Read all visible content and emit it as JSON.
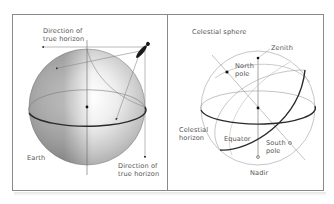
{
  "left_panel": {
    "labels": {
      "direction_top_line1": "Direction of",
      "direction_top_line2": "true horizon",
      "earth": "Earth",
      "direction_bottom_line1": "Direction of",
      "direction_bottom_line2": "true horizon"
    }
  },
  "right_panel": {
    "labels": {
      "title": "Celestial sphere",
      "zenith": "Zenith",
      "north_pole_line1": "North",
      "north_pole_line2": "pole",
      "celestial_horizon_line1": "Celestial",
      "celestial_horizon_line2": "horizon",
      "equator": "Equator",
      "south_pole_line1": "South",
      "south_pole_line2": "pole",
      "nadir": "Nadir"
    }
  },
  "colors": {
    "border": "#8a8a8a",
    "thin_line": "#9a9a9a",
    "thick_line": "#2a2a2a",
    "text": "#555555"
  }
}
